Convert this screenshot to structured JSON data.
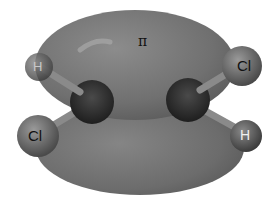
{
  "diagram": {
    "title_symbol": "π",
    "atoms": [
      {
        "label": "H",
        "position": "upper-left"
      },
      {
        "label": "Cl",
        "position": "upper-right"
      },
      {
        "label": "Cl",
        "position": "lower-left"
      },
      {
        "label": "H",
        "position": "lower-right"
      }
    ],
    "colors": {
      "lobe": "#7a7a7a",
      "lobe_dark": "#5f5f5f",
      "carbon": "#3a3a3a",
      "background": "#ffffff"
    }
  }
}
